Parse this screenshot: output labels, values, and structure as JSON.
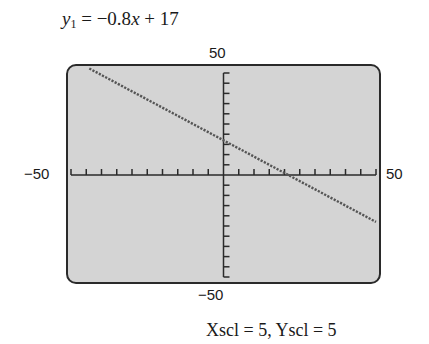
{
  "equation": {
    "var": "y",
    "sub": "1",
    "rhs_prefix": " = −0.8",
    "rhs_x": "x",
    "rhs_suffix": " + 17"
  },
  "window": {
    "ymax_label": "50",
    "ymin_label": "−50",
    "xmin_label": "−50",
    "xmax_label": "50",
    "scale_label": "Xscl = 5,  Yscl = 5"
  },
  "colors": {
    "screen_bg": "#d4d4d4",
    "frame": "#2a2a2a",
    "plot_line": "#555555"
  },
  "chart_data": {
    "type": "line",
    "title": "y1 = −0.8x + 17",
    "function": {
      "slope": -0.8,
      "intercept": 17
    },
    "x": [
      -50,
      50
    ],
    "series": [
      {
        "name": "y1",
        "values": [
          57,
          -23
        ],
        "style": "dotted"
      }
    ],
    "visible_segment": {
      "x": [
        -44,
        50
      ],
      "y": [
        52.2,
        -23
      ]
    },
    "xlim": [
      -50,
      50
    ],
    "ylim": [
      -50,
      50
    ],
    "xscl": 5,
    "yscl": 5,
    "xlabel": "",
    "ylabel": "",
    "tick_labels": {
      "xmin": "−50",
      "xmax": "50",
      "ymin": "−50",
      "ymax": "50"
    },
    "grid": false,
    "x_intercept": 21.25,
    "y_intercept": 17
  }
}
